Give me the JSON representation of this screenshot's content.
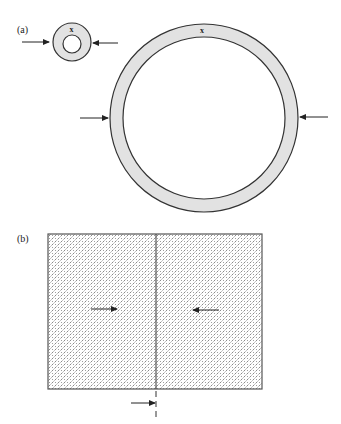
{
  "figure": {
    "panels": [
      {
        "id": "a",
        "label": "(a)",
        "small_ring": {
          "cx": 72,
          "cy": 42,
          "outer_r": 19,
          "inner_r": 9,
          "mark": "x"
        },
        "large_ring": {
          "cx": 204,
          "cy": 118,
          "outer_r": 94,
          "inner_r": 81,
          "mark": "x"
        },
        "arrows": [
          {
            "name": "small-ring-left-arrow",
            "x1": 22,
            "y1": 42,
            "x2": 49,
            "y2": 42,
            "direction": "right"
          },
          {
            "name": "small-ring-right-arrow",
            "x1": 118,
            "y1": 43,
            "x2": 93,
            "y2": 43,
            "direction": "left"
          },
          {
            "name": "large-ring-left-arrow",
            "x1": 80,
            "y1": 118,
            "x2": 107,
            "y2": 118,
            "direction": "right"
          },
          {
            "name": "large-ring-right-arrow",
            "x1": 328,
            "y1": 117,
            "x2": 301,
            "y2": 117,
            "direction": "left"
          }
        ]
      },
      {
        "id": "b",
        "label": "(b)",
        "block": {
          "x": 48,
          "y": 234,
          "width": 214,
          "height": 155,
          "divider_x": 156
        },
        "arrows": [
          {
            "name": "block-left-inner-arrow",
            "x1": 91,
            "y1": 309,
            "x2": 116,
            "y2": 309,
            "direction": "right"
          },
          {
            "name": "block-right-inner-arrow",
            "x1": 219,
            "y1": 310,
            "x2": 194,
            "y2": 310,
            "direction": "left"
          },
          {
            "name": "interface-arrow",
            "x1": 131,
            "y1": 403,
            "x2": 155,
            "y2": 403,
            "direction": "right"
          }
        ],
        "dashed_extension": {
          "x": 156,
          "y1": 389,
          "y2": 421
        }
      }
    ],
    "colors": {
      "ring_fill": "#e2e2e2",
      "stroke": "#333333",
      "pattern_dot": "#8a8a8a"
    }
  }
}
